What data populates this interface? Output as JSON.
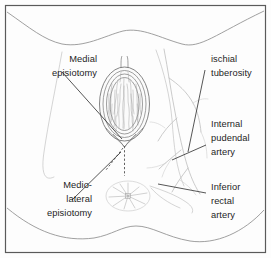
{
  "figure": {
    "background_color": "#fdfdfd",
    "frame_color": "#5a5a5a",
    "ink_color": "#1d1d1d",
    "artery_color": "#c2c2c2",
    "width": 271,
    "height": 258
  },
  "labels": {
    "medial_episiotomy": {
      "lines": [
        "Medial",
        "episiotomy"
      ],
      "line1": "Medial",
      "line2": "episiotomy",
      "side": "left",
      "anchor_x": 97,
      "anchor_y": 62
    },
    "mediolateral_episiotomy": {
      "lines": [
        "Medio-",
        "lateral",
        "episiotomy"
      ],
      "line1": "Medio-",
      "line2": "lateral",
      "line3": "episiotomy",
      "side": "left",
      "anchor_x": 97,
      "anchor_y": 188
    },
    "ischial_tuberosity": {
      "lines": [
        "ischial",
        "tuberosity"
      ],
      "line1": "ischial",
      "line2": "tuberosity",
      "side": "right",
      "anchor_x": 211,
      "anchor_y": 62
    },
    "internal_pudendal_artery": {
      "lines": [
        "Internal",
        "pudendal",
        "artery"
      ],
      "line1": "Internal",
      "line2": "pudendal",
      "line3": "artery",
      "side": "right",
      "anchor_x": 211,
      "anchor_y": 127
    },
    "inferior_rectal_artery": {
      "lines": [
        "Inferior",
        "rectal",
        "artery"
      ],
      "line1": "Inferior",
      "line2": "rectal",
      "line3": "artery",
      "side": "right",
      "anchor_x": 211,
      "anchor_y": 190
    }
  },
  "anatomy": {
    "structures": [
      "vulva-vaginal-opening",
      "labia",
      "anus",
      "perineum",
      "thigh-contour-left",
      "thigh-contour-right",
      "buttock-contour"
    ],
    "incisions": [
      "medial-episiotomy-incision",
      "mediolateral-episiotomy-incision"
    ],
    "vessels": [
      "internal-pudendal-artery",
      "inferior-rectal-artery"
    ]
  }
}
